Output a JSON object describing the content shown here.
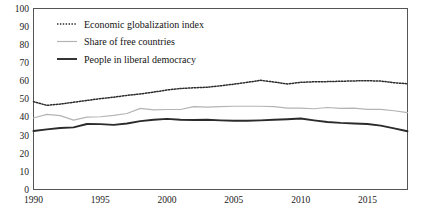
{
  "chart_data": {
    "type": "line",
    "title": "",
    "subtitle": "",
    "xlabel": "",
    "ylabel": "",
    "xlim": [
      1990,
      2018
    ],
    "ylim": [
      0,
      100
    ],
    "grid": false,
    "legend_position": "top-left",
    "xticks": [
      "1990",
      "1995",
      "2000",
      "2005",
      "2010",
      "2015"
    ],
    "xtick_values": [
      1990,
      1995,
      2000,
      2005,
      2010,
      2015
    ],
    "yticks": [
      "0",
      "10",
      "20",
      "30",
      "40",
      "50",
      "60",
      "70",
      "80",
      "90",
      "100"
    ],
    "ytick_values": [
      0,
      10,
      20,
      30,
      40,
      50,
      60,
      70,
      80,
      90,
      100
    ],
    "x": [
      1990,
      1991,
      1992,
      1993,
      1994,
      1995,
      1996,
      1997,
      1998,
      1999,
      2000,
      2001,
      2002,
      2003,
      2004,
      2005,
      2006,
      2007,
      2008,
      2009,
      2010,
      2011,
      2012,
      2013,
      2014,
      2015,
      2016,
      2017,
      2018
    ],
    "series": [
      {
        "name": "Economic globalization index",
        "style": "dotted",
        "color": "#2b2b2b",
        "values": [
          48.5,
          46.5,
          47.2,
          48.2,
          49.2,
          50.2,
          51.0,
          52.0,
          52.8,
          53.8,
          55.0,
          55.8,
          56.2,
          56.5,
          57.3,
          58.2,
          59.2,
          60.3,
          59.4,
          58.3,
          59.2,
          59.5,
          59.6,
          59.8,
          60.0,
          60.1,
          59.9,
          59.0,
          58.4
        ]
      },
      {
        "name": "Share of free countries",
        "style": "solid-light",
        "color": "#b4b4b4",
        "values": [
          39.5,
          41.5,
          40.8,
          38.3,
          40.0,
          40.2,
          41.0,
          42.0,
          44.8,
          44.0,
          44.2,
          44.2,
          45.8,
          45.5,
          45.8,
          46.0,
          46.0,
          46.0,
          45.8,
          45.0,
          45.0,
          44.6,
          45.3,
          44.8,
          45.0,
          44.3,
          44.3,
          43.5,
          42.5
        ]
      },
      {
        "name": "People in liberal democracy",
        "style": "solid-dark",
        "color": "#2b2b2b",
        "values": [
          32.3,
          33.2,
          34.0,
          34.3,
          36.2,
          36.1,
          35.7,
          36.5,
          37.8,
          38.5,
          39.0,
          38.5,
          38.4,
          38.5,
          38.2,
          38.0,
          38.0,
          38.2,
          38.5,
          38.8,
          39.2,
          38.2,
          37.3,
          36.8,
          36.5,
          36.2,
          35.3,
          33.8,
          32.2
        ]
      }
    ]
  },
  "legend": {
    "items": [
      {
        "label": "Economic globalization index"
      },
      {
        "label": "Share of free countries"
      },
      {
        "label": "People in liberal democracy"
      }
    ]
  }
}
